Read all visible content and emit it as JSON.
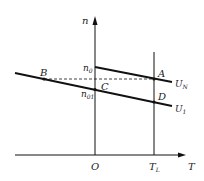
{
  "diagram": {
    "type": "motor speed-torque characteristic",
    "axes": {
      "y_label": "n",
      "x_label": "T",
      "origin_label": "O",
      "x_tick_label_main": "T",
      "x_tick_label_sub": "L"
    },
    "y_ticks": {
      "n0_main": "n",
      "n0_sub": "0",
      "n01_main": "n",
      "n01_sub": "01"
    },
    "points": {
      "A": "A",
      "B": "B",
      "C": "C",
      "D": "D"
    },
    "curves": [
      {
        "name": "U_N",
        "main": "U",
        "sub": "N"
      },
      {
        "name": "U_1",
        "main": "U",
        "sub": "1"
      }
    ],
    "colors": {
      "line": "#111111",
      "background": "#ffffff"
    }
  }
}
